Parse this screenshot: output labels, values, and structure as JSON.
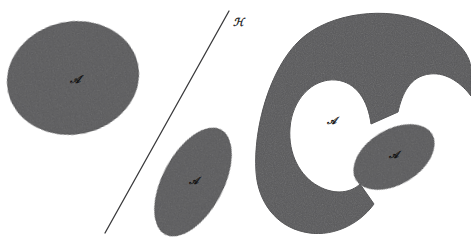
{
  "figure": {
    "background_color": "#ffffff",
    "region_fill_color": "#58585a",
    "region_edge_color": "#4a4a4c",
    "line_color": "#3a3a3c",
    "label_color": "#141414",
    "width": 471,
    "height": 247
  },
  "regions": [
    {
      "id": "left-ellipse",
      "shape": "ellipse",
      "label": "𝒜",
      "label_plain": "A",
      "center": [
        73,
        78
      ],
      "radii": [
        66,
        56
      ],
      "rotation_deg": -12,
      "label_position": [
        75,
        80
      ]
    },
    {
      "id": "middle-ellipse",
      "shape": "ellipse",
      "label": "𝒜",
      "label_plain": "A",
      "center": [
        193,
        182
      ],
      "radii": [
        59,
        30
      ],
      "rotation_deg": -62,
      "label_position": [
        193,
        181
      ]
    },
    {
      "id": "crescent",
      "shape": "crescent",
      "label": "𝒜",
      "label_plain": "A",
      "center": [
        372,
        143
      ],
      "label_position": [
        331,
        121
      ]
    },
    {
      "id": "inner-ellipse",
      "shape": "ellipse",
      "label": "𝒜",
      "label_plain": "A",
      "center": [
        394,
        157
      ],
      "radii": [
        44,
        27
      ],
      "rotation_deg": -31,
      "label_position": [
        393,
        155
      ]
    }
  ],
  "line": {
    "id": "diagonal-line",
    "label": "ℋ",
    "label_plain": "H",
    "start": [
      105,
      233
    ],
    "end": [
      229,
      11
    ],
    "label_position": [
      238,
      23
    ],
    "stroke_width": 1.3
  }
}
